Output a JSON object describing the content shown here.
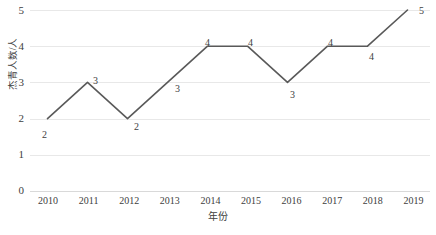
{
  "chart_data": {
    "type": "line",
    "title": "",
    "xlabel": "年份",
    "ylabel": "杰青人数/人",
    "categories": [
      "2010",
      "2011",
      "2012",
      "2013",
      "2014",
      "2015",
      "2016",
      "2017",
      "2018",
      "2019"
    ],
    "values": [
      2,
      3,
      2,
      3,
      4,
      4,
      3,
      4,
      4,
      5
    ],
    "series": [
      {
        "name": "杰青人数",
        "values": [
          2,
          3,
          2,
          3,
          4,
          4,
          3,
          4,
          4,
          5
        ]
      }
    ],
    "point_labels": [
      "2",
      "3",
      "2",
      "3",
      "4",
      "4",
      "3",
      "4",
      "4",
      "5"
    ],
    "yticks": [
      "0",
      "1",
      "2",
      "3",
      "4",
      "5"
    ],
    "ylim": [
      0,
      5
    ],
    "xticks": [
      "2010",
      "2011",
      "2012",
      "2013",
      "2014",
      "2015",
      "2016",
      "2017",
      "2018",
      "2019"
    ],
    "grid": true,
    "legend": "none",
    "line_color": "#595959",
    "grid_color": "#e8e8e8",
    "text_color": "#404040",
    "background": "#ffffff",
    "markers": false
  }
}
